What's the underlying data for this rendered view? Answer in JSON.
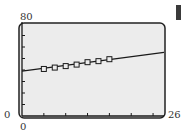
{
  "chart_data": {
    "type": "scatter",
    "title": "",
    "xlabel": "",
    "ylabel": "",
    "xlim": [
      0,
      26
    ],
    "ylim": [
      0,
      80
    ],
    "x_tick_step": 4,
    "y_tick_step": 10,
    "grid": false,
    "legend": null,
    "window_labels": {
      "ymax": "80",
      "xmin_left": "0",
      "xmax": "26",
      "xmin_bottom": "0"
    },
    "series": [
      {
        "name": "data",
        "marker": "square",
        "x": [
          4,
          6,
          8,
          10,
          12,
          14,
          16
        ],
        "y": [
          40.9,
          42.1,
          43.4,
          44.7,
          46.8,
          47.7,
          49.4
        ]
      },
      {
        "name": "regression line",
        "type": "line",
        "x": [
          0,
          26
        ],
        "y": [
          39.1,
          55.3
        ]
      }
    ]
  },
  "colors": {
    "plot_bg": "#ececec",
    "ink": "#1a1a1a",
    "frame": "#222222"
  }
}
